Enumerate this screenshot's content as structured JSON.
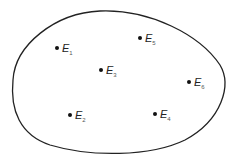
{
  "diagram": {
    "type": "sample-space",
    "boundary": {
      "shape": "egg-shaped closed curve",
      "stroke": "#222222"
    },
    "points": [
      {
        "label": "E",
        "subscript": "1",
        "x": 57,
        "y": 48
      },
      {
        "label": "E",
        "subscript": "2",
        "x": 70,
        "y": 115
      },
      {
        "label": "E",
        "subscript": "3",
        "x": 101,
        "y": 70
      },
      {
        "label": "E",
        "subscript": "4",
        "x": 155,
        "y": 114
      },
      {
        "label": "E",
        "subscript": "5",
        "x": 140,
        "y": 38
      },
      {
        "label": "E",
        "subscript": "6",
        "x": 189,
        "y": 82
      }
    ]
  }
}
